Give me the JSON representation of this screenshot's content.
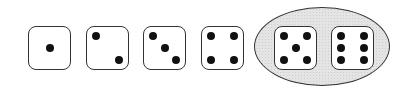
{
  "diagram": {
    "dice": [
      {
        "value": 1,
        "left": 28
      },
      {
        "value": 2,
        "left": 86
      },
      {
        "value": 3,
        "left": 143
      },
      {
        "value": 4,
        "left": 201
      },
      {
        "value": 5,
        "left": 274,
        "highlighted": true
      },
      {
        "value": 6,
        "left": 331,
        "highlighted": true
      }
    ],
    "highlight": {
      "shape": "ellipse",
      "contains": [
        5,
        6
      ],
      "fill": "#e4e4e4",
      "stroke": "#333333"
    }
  }
}
